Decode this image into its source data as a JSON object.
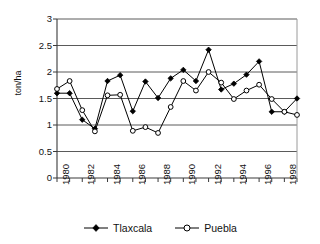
{
  "chart_data": {
    "type": "line",
    "title": "",
    "xlabel": "",
    "ylabel": "ton/ha",
    "x": [
      1980,
      1981,
      1982,
      1983,
      1984,
      1985,
      1986,
      1987,
      1988,
      1989,
      1990,
      1991,
      1992,
      1993,
      1994,
      1995,
      1996,
      1997,
      1998,
      1999
    ],
    "xlim": [
      1980,
      1999
    ],
    "ylim": [
      0,
      3
    ],
    "yticks": [
      "0",
      "0.5",
      "1",
      "1.5",
      "2",
      "2.5",
      "3"
    ],
    "ytick_values": [
      0,
      0.5,
      1,
      1.5,
      2,
      2.5,
      3
    ],
    "xticks": [
      "1980",
      "1982",
      "1984",
      "1986",
      "1988",
      "1990",
      "1992",
      "1994",
      "1996",
      "1998"
    ],
    "xtick_values": [
      1980,
      1982,
      1984,
      1986,
      1988,
      1990,
      1992,
      1994,
      1996,
      1998
    ],
    "grid": "horizontal",
    "legend_position": "bottom",
    "series": [
      {
        "name": "Tlaxcala",
        "marker": "filled-diamond",
        "color": "#000000",
        "values": [
          1.6,
          1.6,
          1.1,
          0.93,
          1.83,
          1.94,
          1.26,
          1.82,
          1.51,
          1.88,
          2.04,
          1.83,
          2.42,
          1.67,
          1.78,
          1.95,
          2.2,
          1.25,
          1.25,
          1.5
        ]
      },
      {
        "name": "Puebla",
        "marker": "open-circle",
        "color": "#000000",
        "values": [
          1.68,
          1.83,
          1.28,
          0.88,
          1.56,
          1.57,
          0.89,
          0.96,
          0.85,
          1.34,
          1.83,
          1.65,
          2.0,
          1.8,
          1.49,
          1.65,
          1.76,
          1.49,
          1.25,
          1.19
        ]
      }
    ]
  },
  "legend": {
    "items": [
      {
        "label": "Tlaxcala"
      },
      {
        "label": "Puebla"
      }
    ]
  },
  "axes": {
    "y_title": "ton/ha"
  }
}
